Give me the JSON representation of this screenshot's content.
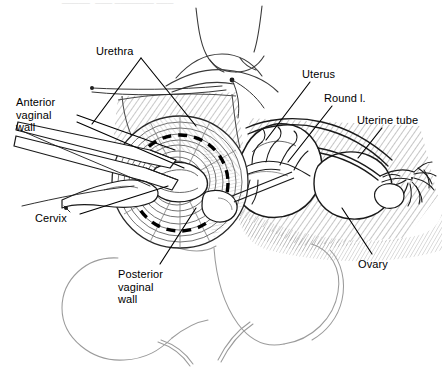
{
  "figure": {
    "kind": "anatomical-line-drawing",
    "background_color": "#ffffff",
    "ink_color": "#000000",
    "hatch_color": "#7a7a7a",
    "outline_color": "#9b9b9b",
    "cropped_caption_top": "_____  ___ _______ ___"
  },
  "labels": [
    {
      "id": "urethra",
      "text": "Urethra",
      "x": 96,
      "y": 45,
      "align": "left",
      "leaders": [
        {
          "x1": 141,
          "y1": 58,
          "x2": 196,
          "y2": 126
        },
        {
          "x1": 141,
          "y1": 58,
          "x2": 92,
          "y2": 124
        }
      ]
    },
    {
      "id": "anterior-vaginal-wall",
      "text": "Anterior\nvaginal\nwall",
      "x": 16,
      "y": 96,
      "align": "left",
      "leaders": [
        {
          "x1": 77,
          "y1": 115,
          "x2": 175,
          "y2": 150
        },
        {
          "x1": 77,
          "y1": 122,
          "x2": 184,
          "y2": 168
        }
      ]
    },
    {
      "id": "cervix",
      "text": "Cervix",
      "x": 35,
      "y": 212,
      "align": "left",
      "leaders": [
        {
          "x1": 80,
          "y1": 214,
          "x2": 168,
          "y2": 186
        }
      ]
    },
    {
      "id": "posterior-vaginal-wall",
      "text": "Posterior\nvaginal\nwall",
      "x": 118,
      "y": 268,
      "align": "left",
      "leaders": [
        {
          "x1": 160,
          "y1": 264,
          "x2": 196,
          "y2": 208
        }
      ]
    },
    {
      "id": "uterus",
      "text": "Uterus",
      "x": 302,
      "y": 68,
      "align": "left",
      "leaders": [
        {
          "x1": 310,
          "y1": 82,
          "x2": 266,
          "y2": 140
        }
      ]
    },
    {
      "id": "round-ligament",
      "text": "Round l.",
      "x": 324,
      "y": 92,
      "align": "left",
      "leaders": [
        {
          "x1": 332,
          "y1": 106,
          "x2": 288,
          "y2": 162
        }
      ]
    },
    {
      "id": "uterine-tube",
      "text": "Uterine tube",
      "x": 357,
      "y": 114,
      "align": "left",
      "leaders": [
        {
          "x1": 382,
          "y1": 128,
          "x2": 358,
          "y2": 158
        }
      ]
    },
    {
      "id": "ovary",
      "text": "Ovary",
      "x": 358,
      "y": 258,
      "align": "left",
      "leaders": [
        {
          "x1": 372,
          "y1": 254,
          "x2": 342,
          "y2": 208
        }
      ]
    }
  ],
  "structures": [
    {
      "id": "mons-pubis",
      "name": "Mons pubis / perineal body"
    },
    {
      "id": "left-thigh",
      "name": "Left thigh outline"
    },
    {
      "id": "right-thigh",
      "name": "Right thigh outline"
    },
    {
      "id": "vaginal-vault",
      "name": "Vaginal vault with concentric rugae"
    },
    {
      "id": "incision-line",
      "name": "Circumferential dashed incision line around cervix"
    },
    {
      "id": "retractor-upper",
      "name": "Upper vaginal retractor blade"
    },
    {
      "id": "retractor-lower",
      "name": "Lower vaginal retractor blade"
    },
    {
      "id": "tenaculum",
      "name": "Tenaculum grasping cervix"
    },
    {
      "id": "uterus-body",
      "name": "Uterine corpus"
    },
    {
      "id": "round-ligament-cord",
      "name": "Round ligament"
    },
    {
      "id": "uterine-vessels",
      "name": "Uterine vessels / vascular arcade"
    },
    {
      "id": "fallopian-tube",
      "name": "Fallopian tube"
    },
    {
      "id": "fimbriae",
      "name": "Fimbriated end of fallopian tube"
    },
    {
      "id": "ovary-body",
      "name": "Ovary"
    },
    {
      "id": "broad-ligament",
      "name": "Broad ligament hatched field"
    }
  ]
}
